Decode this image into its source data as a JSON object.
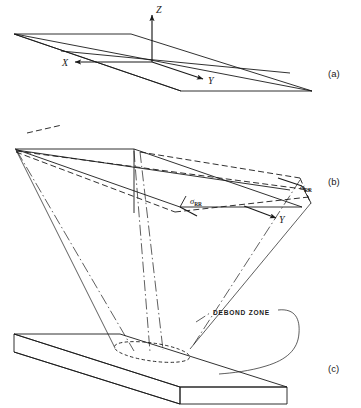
{
  "figure": {
    "background_color": "#ffffff",
    "line_color": "#1a1a1a",
    "panels": [
      {
        "id": "a",
        "label": "(a)",
        "description": "Flat rectangular plate shown in isometric projection with right-handed cartesian coordinate axes at its center",
        "axis_labels": {
          "x": "X",
          "y": "Y",
          "z": "Z"
        }
      },
      {
        "id": "b",
        "label": "(b)",
        "description": "Deformed plate showing undeformed outline in solid lines and deformed shape in dashed lines, with in-plane stress arrows",
        "axis_labels": {
          "y": "Y"
        },
        "stress_labels": [
          {
            "symbol": "σ",
            "subscript": "RR",
            "position": "lower-center"
          },
          {
            "symbol": "σ",
            "subscript": "RR",
            "position": "right"
          }
        ]
      },
      {
        "id": "c",
        "label": "(c)",
        "description": "Thick plate slab in isometric projection with a dashed elliptical debond zone on its top surface, connected by a curved leader line to its caption",
        "annotations": [
          {
            "text": "DEBOND ZONE",
            "leader": "curved-hook"
          }
        ]
      }
    ]
  }
}
